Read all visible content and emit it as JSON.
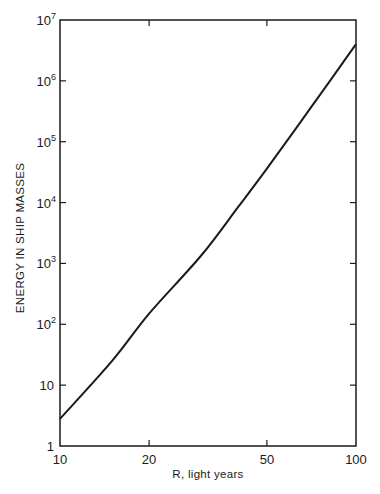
{
  "chart_data": {
    "type": "line",
    "title": "",
    "xlabel": "R, light years",
    "ylabel": "ENERGY IN SHIP MASSES",
    "xscale": "log",
    "yscale": "log",
    "xlim": [
      10,
      100
    ],
    "ylim": [
      1,
      10000000
    ],
    "x_ticks": [
      {
        "value": 10,
        "label": "10"
      },
      {
        "value": 20,
        "label": "20"
      },
      {
        "value": 50,
        "label": "50"
      },
      {
        "value": 100,
        "label": "100"
      }
    ],
    "y_ticks": [
      {
        "value": 1,
        "base": "1",
        "exp": ""
      },
      {
        "value": 10,
        "base": "10",
        "exp": ""
      },
      {
        "value": 100,
        "base": "10",
        "exp": "2"
      },
      {
        "value": 1000,
        "base": "10",
        "exp": "3"
      },
      {
        "value": 10000,
        "base": "10",
        "exp": "4"
      },
      {
        "value": 100000,
        "base": "10",
        "exp": "5"
      },
      {
        "value": 1000000,
        "base": "10",
        "exp": "6"
      },
      {
        "value": 10000000,
        "base": "10",
        "exp": "7"
      }
    ],
    "grid": false,
    "legend": null,
    "series": [
      {
        "name": "Energy",
        "x": [
          10,
          15,
          20,
          30,
          40,
          50,
          70,
          100
        ],
        "y": [
          2.8,
          25,
          150,
          1350,
          8500,
          36000,
          350000,
          4000000
        ]
      }
    ],
    "line_color": "#1a1a1a"
  }
}
